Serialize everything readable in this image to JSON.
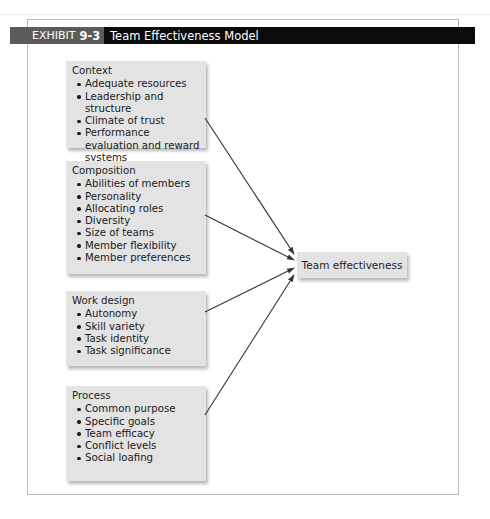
{
  "exhibit": {
    "label": "EXHIBIT",
    "number": "9-3",
    "title": "Team Effectiveness Model"
  },
  "inputs": [
    {
      "heading": "Context",
      "items": [
        "Adequate resources",
        "Leadership and structure",
        "Climate of trust",
        "Performance evaluation and reward systems"
      ]
    },
    {
      "heading": "Composition",
      "items": [
        "Abilities of members",
        "Personality",
        "Allocating roles",
        "Diversity",
        "Size of teams",
        "Member flexibility",
        "Member preferences"
      ]
    },
    {
      "heading": "Work design",
      "items": [
        "Autonomy",
        "Skill variety",
        "Task identity",
        "Task significance"
      ]
    },
    {
      "heading": "Process",
      "items": [
        "Common purpose",
        "Specific goals",
        "Team efficacy",
        "Conflict levels",
        "Social loafing"
      ]
    }
  ],
  "outcome": {
    "label": "Team effectiveness"
  },
  "arrows": [
    {
      "from": "Context",
      "to": "Team effectiveness"
    },
    {
      "from": "Composition",
      "to": "Team effectiveness"
    },
    {
      "from": "Work design",
      "to": "Team effectiveness"
    },
    {
      "from": "Process",
      "to": "Team effectiveness"
    }
  ],
  "colors": {
    "box_fill": "#e3e3e3",
    "exhibit_label_bg": "#5b5b5b",
    "title_bg": "#0b0b0b",
    "arrow": "#333333",
    "frame": "#b9b9b9"
  }
}
